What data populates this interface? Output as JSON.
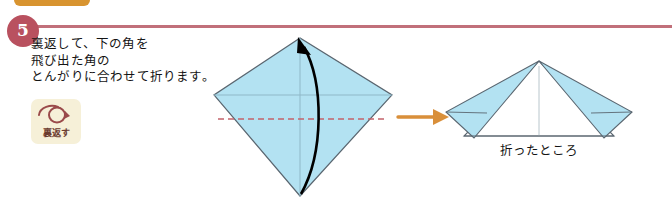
{
  "page": {
    "background": "#ffffff",
    "width": 672,
    "height": 202
  },
  "orange_tab": {
    "label": "折り方",
    "color": "#d89430"
  },
  "step": {
    "number": "5",
    "badge_color": "#b9515f",
    "rule_color": "#c1707a",
    "instruction_lines": [
      "裏返して、下の角を",
      "飛び出た角の",
      "とんがりに合わせて折ります。"
    ]
  },
  "flip_icon": {
    "name": "turn-over-icon",
    "label": "裏返す",
    "badge_color": "#f6f0d8",
    "glyph_color": "#9a4a4a",
    "label_color": "#6b3b2e"
  },
  "diagrams": {
    "before": {
      "name": "kite-diamond-before",
      "paper_fill": "#b3e2f2",
      "edge_color": "#5a6670",
      "crease_color": "#8fb8c8",
      "fold_line_color": "#c4636b",
      "fold_line_style": "dashed",
      "motion_arrow_color": "#000000",
      "motion_arrow_direction": "bottom-to-top"
    },
    "transition": {
      "name": "transition-arrow",
      "color": "#d98f3a",
      "direction": "right"
    },
    "after": {
      "name": "folded-result",
      "paper_fill_front": "#ffffff",
      "paper_fill_flap": "#b3e2f2",
      "edge_color": "#5a6670",
      "caption": "折ったところ"
    }
  }
}
